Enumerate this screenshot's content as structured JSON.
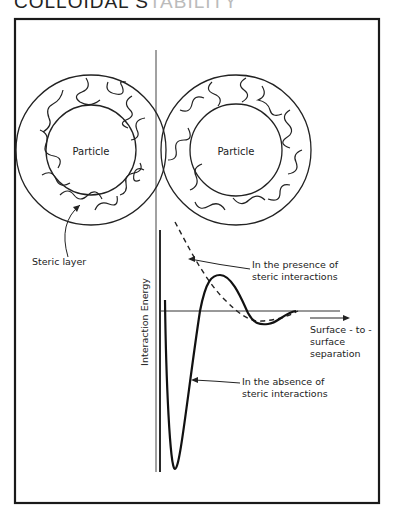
{
  "header": {
    "title_dark": "COLLOIDAL S",
    "title_faded": "TABILITY"
  },
  "figure": {
    "particles": [
      {
        "label": "Particle"
      },
      {
        "label": "Particle"
      }
    ],
    "steric_layer_label": "Steric layer",
    "y_axis_label": "Interaction  Energy",
    "x_axis_label_lines": [
      "Surface - to -",
      "surface",
      "separation"
    ],
    "curves": {
      "presence": {
        "label_lines": [
          "In the presence of",
          "steric interactions"
        ],
        "style": "dashed"
      },
      "absence": {
        "label_lines": [
          "In the absence of",
          "steric interactions"
        ],
        "style": "solid"
      }
    },
    "stroke_color": "#222222",
    "frame_color": "#1a1a1a"
  }
}
